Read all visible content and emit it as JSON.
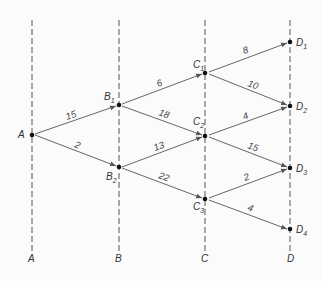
{
  "diagram": {
    "type": "staged network (shortest-path / dynamic programming)",
    "stages": [
      {
        "id": "A",
        "label": "A"
      },
      {
        "id": "B",
        "label": "B"
      },
      {
        "id": "C",
        "label": "C"
      },
      {
        "id": "D",
        "label": "D"
      }
    ],
    "nodes": [
      {
        "id": "A",
        "main": "A",
        "sub": ""
      },
      {
        "id": "B1",
        "main": "B",
        "sub": "1"
      },
      {
        "id": "B2",
        "main": "B",
        "sub": "2"
      },
      {
        "id": "C1",
        "main": "C",
        "sub": "1"
      },
      {
        "id": "C2",
        "main": "C",
        "sub": "2"
      },
      {
        "id": "C3",
        "main": "C",
        "sub": "3"
      },
      {
        "id": "D1",
        "main": "D",
        "sub": "1"
      },
      {
        "id": "D2",
        "main": "D",
        "sub": "2"
      },
      {
        "id": "D3",
        "main": "D",
        "sub": "3"
      },
      {
        "id": "D4",
        "main": "D",
        "sub": "4"
      }
    ],
    "edges": [
      {
        "from": "A",
        "to": "B1",
        "weight": "15"
      },
      {
        "from": "A",
        "to": "B2",
        "weight": "2"
      },
      {
        "from": "B1",
        "to": "C1",
        "weight": "6"
      },
      {
        "from": "B1",
        "to": "C2",
        "weight": "18"
      },
      {
        "from": "B2",
        "to": "C2",
        "weight": "13"
      },
      {
        "from": "B2",
        "to": "C3",
        "weight": "22"
      },
      {
        "from": "C1",
        "to": "D1",
        "weight": "8"
      },
      {
        "from": "C1",
        "to": "D2",
        "weight": "10"
      },
      {
        "from": "C2",
        "to": "D2",
        "weight": "4"
      },
      {
        "from": "C2",
        "to": "D3",
        "weight": "15"
      },
      {
        "from": "C3",
        "to": "D3",
        "weight": "2"
      },
      {
        "from": "C3",
        "to": "D4",
        "weight": "4"
      }
    ]
  }
}
